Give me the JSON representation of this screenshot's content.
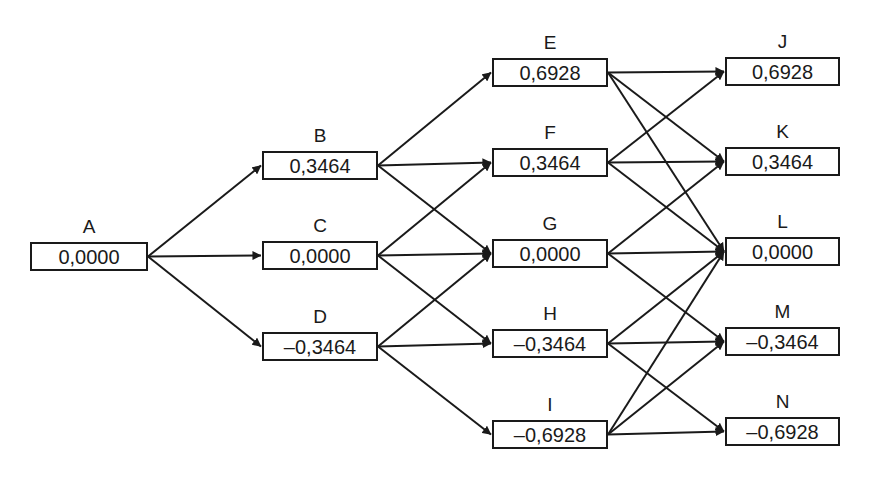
{
  "diagram": {
    "type": "trinomial-tree",
    "stroke_color": "#1a1a1a",
    "nodes": [
      {
        "id": "A",
        "label": "A",
        "value": "0,0000",
        "x": 30,
        "y": 242,
        "w": 118,
        "h": 29
      },
      {
        "id": "B",
        "label": "B",
        "value": "0,3464",
        "x": 262,
        "y": 151,
        "w": 116,
        "h": 29
      },
      {
        "id": "C",
        "label": "C",
        "value": "0,0000",
        "x": 262,
        "y": 241,
        "w": 116,
        "h": 29
      },
      {
        "id": "D",
        "label": "D",
        "value": "–0,3464",
        "x": 262,
        "y": 332,
        "w": 116,
        "h": 29
      },
      {
        "id": "E",
        "label": "E",
        "value": "0,6928",
        "x": 492,
        "y": 58,
        "w": 116,
        "h": 29
      },
      {
        "id": "F",
        "label": "F",
        "value": "0,3464",
        "x": 492,
        "y": 148,
        "w": 116,
        "h": 29
      },
      {
        "id": "G",
        "label": "G",
        "value": "0,0000",
        "x": 492,
        "y": 239,
        "w": 116,
        "h": 29
      },
      {
        "id": "H",
        "label": "H",
        "value": "–0,3464",
        "x": 492,
        "y": 329,
        "w": 116,
        "h": 29
      },
      {
        "id": "I",
        "label": "I",
        "value": "–0,6928",
        "x": 492,
        "y": 420,
        "w": 116,
        "h": 29
      },
      {
        "id": "J",
        "label": "J",
        "value": "0,6928",
        "x": 725,
        "y": 57,
        "w": 115,
        "h": 29
      },
      {
        "id": "K",
        "label": "K",
        "value": "0,3464",
        "x": 725,
        "y": 147,
        "w": 115,
        "h": 29
      },
      {
        "id": "L",
        "label": "L",
        "value": "0,0000",
        "x": 725,
        "y": 237,
        "w": 115,
        "h": 29
      },
      {
        "id": "M",
        "label": "M",
        "value": "–0,3464",
        "x": 725,
        "y": 327,
        "w": 115,
        "h": 29
      },
      {
        "id": "N",
        "label": "N",
        "value": "–0,6928",
        "x": 725,
        "y": 417,
        "w": 115,
        "h": 29
      }
    ],
    "edges": [
      [
        "A",
        "B"
      ],
      [
        "A",
        "C"
      ],
      [
        "A",
        "D"
      ],
      [
        "B",
        "E"
      ],
      [
        "B",
        "F"
      ],
      [
        "B",
        "G"
      ],
      [
        "C",
        "F"
      ],
      [
        "C",
        "G"
      ],
      [
        "C",
        "H"
      ],
      [
        "D",
        "G"
      ],
      [
        "D",
        "H"
      ],
      [
        "D",
        "I"
      ],
      [
        "E",
        "J"
      ],
      [
        "E",
        "K"
      ],
      [
        "E",
        "L"
      ],
      [
        "F",
        "J"
      ],
      [
        "F",
        "K"
      ],
      [
        "F",
        "L"
      ],
      [
        "G",
        "K"
      ],
      [
        "G",
        "L"
      ],
      [
        "G",
        "M"
      ],
      [
        "H",
        "L"
      ],
      [
        "H",
        "M"
      ],
      [
        "H",
        "N"
      ],
      [
        "I",
        "L"
      ],
      [
        "I",
        "M"
      ],
      [
        "I",
        "N"
      ]
    ]
  }
}
